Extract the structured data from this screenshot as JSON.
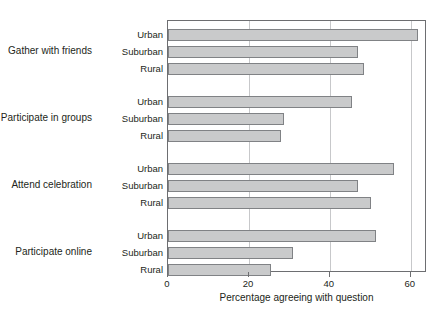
{
  "chart_data": {
    "type": "bar",
    "orientation": "horizontal",
    "title": "",
    "xlabel": "Percentage agreeing with question",
    "ylabel": "",
    "xlim": [
      0,
      64
    ],
    "xticks": [
      0,
      20,
      40,
      60
    ],
    "xtick_labels": [
      "0",
      "20",
      "40",
      "60"
    ],
    "grid": true,
    "grid_axis": "x",
    "legend": "none",
    "bar_color": "#c9cacb",
    "bar_edge_color": "#808285",
    "axis_color": "#6d6e71",
    "grid_color": "#c7c8ca",
    "groups": [
      {
        "label": "Gather with friends",
        "categories": [
          "Urban",
          "Suburban",
          "Rural"
        ],
        "values": [
          61.7,
          46.9,
          48.4
        ]
      },
      {
        "label": "Participate in groups",
        "categories": [
          "Urban",
          "Suburban",
          "Rural"
        ],
        "values": [
          45.4,
          28.6,
          27.9
        ]
      },
      {
        "label": "Attend celebration",
        "categories": [
          "Urban",
          "Suburban",
          "Rural"
        ],
        "values": [
          55.8,
          46.9,
          50.1
        ]
      },
      {
        "label": "Participate online",
        "categories": [
          "Urban",
          "Suburban",
          "Rural"
        ],
        "values": [
          51.4,
          30.9,
          25.4
        ]
      }
    ]
  }
}
